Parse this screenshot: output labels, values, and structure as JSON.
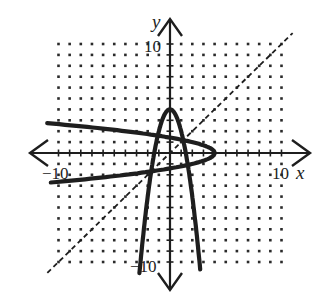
{
  "chart_data": {
    "type": "line",
    "title": "",
    "xlabel": "x",
    "ylabel": "y",
    "xlim": [
      -10,
      10
    ],
    "ylim": [
      -10,
      10
    ],
    "grid": "dots",
    "grid_step": 1,
    "tick_labels": {
      "x": [
        {
          "value": -10,
          "label": "−10"
        },
        {
          "value": 10,
          "label": "10"
        }
      ],
      "y": [
        {
          "value": 10,
          "label": "10"
        },
        {
          "value": -10,
          "label": "−10"
        }
      ]
    },
    "series": [
      {
        "name": "f(x) = 4 − 2x²",
        "style": "solid-thick",
        "points": [
          [
            -2.74,
            -11
          ],
          [
            -2,
            -4
          ],
          [
            -1.41,
            0
          ],
          [
            -1,
            2
          ],
          [
            0,
            4
          ],
          [
            1,
            2
          ],
          [
            1.41,
            0
          ],
          [
            2,
            -4
          ],
          [
            2.74,
            -11
          ]
        ]
      },
      {
        "name": "inverse relation x = 4 − 2y²",
        "style": "solid-thick",
        "points": [
          [
            -11,
            2.74
          ],
          [
            -4,
            2
          ],
          [
            0,
            1.41
          ],
          [
            2,
            1
          ],
          [
            4,
            0
          ],
          [
            2,
            -1
          ],
          [
            0,
            -1.41
          ],
          [
            -4,
            -2
          ],
          [
            -11,
            -2.74
          ]
        ]
      },
      {
        "name": "y = x",
        "style": "dashed",
        "points": [
          [
            -11,
            -11
          ],
          [
            11,
            11
          ]
        ]
      }
    ]
  },
  "labels": {
    "x_axis": "x",
    "y_axis": "y",
    "x_min": "−10",
    "x_max": "10",
    "y_max": "10",
    "y_min": "−10"
  },
  "colors": {
    "curve": "#1e1e1e",
    "grid_dot": "#2a2a2a",
    "axis": "#1e1e1e",
    "background": "#ffffff"
  }
}
